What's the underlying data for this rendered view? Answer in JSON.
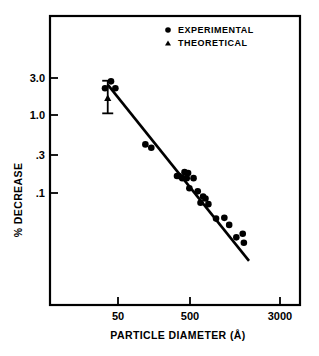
{
  "chart_data": {
    "type": "scatter",
    "title": "",
    "xlabel": "PARTICLE   DIAMETER (Å)",
    "ylabel": "% DECREASE",
    "xscale": "log",
    "yscale": "log",
    "xlim": [
      25,
      4000
    ],
    "ylim": [
      0.012,
      5.0
    ],
    "xticks": [
      50,
      500,
      3000
    ],
    "xtick_labels": [
      "50",
      "500",
      "3000"
    ],
    "yticks": [
      3.0,
      1.0,
      0.3,
      0.1
    ],
    "ytick_labels": [
      "3.0",
      "1.0",
      ".3",
      ".1"
    ],
    "grid": false,
    "legend_position": "top-right",
    "legend": [
      {
        "label": "EXPERIMENTAL",
        "marker": "circle"
      },
      {
        "label": "THEORETICAL",
        "marker": "triangle"
      }
    ],
    "series": [
      {
        "name": "EXPERIMENTAL",
        "marker": "circle",
        "points": [
          {
            "x": 33,
            "y": 2.2
          },
          {
            "x": 40,
            "y": 2.7
          },
          {
            "x": 46,
            "y": 2.2
          },
          {
            "x": 120,
            "y": 0.42
          },
          {
            "x": 145,
            "y": 0.38
          },
          {
            "x": 330,
            "y": 0.165
          },
          {
            "x": 350,
            "y": 0.165
          },
          {
            "x": 390,
            "y": 0.155
          },
          {
            "x": 420,
            "y": 0.185
          },
          {
            "x": 450,
            "y": 0.155
          },
          {
            "x": 470,
            "y": 0.18
          },
          {
            "x": 490,
            "y": 0.115
          },
          {
            "x": 560,
            "y": 0.155
          },
          {
            "x": 640,
            "y": 0.105
          },
          {
            "x": 700,
            "y": 0.075
          },
          {
            "x": 760,
            "y": 0.09
          },
          {
            "x": 820,
            "y": 0.085
          },
          {
            "x": 900,
            "y": 0.072
          },
          {
            "x": 1150,
            "y": 0.047
          },
          {
            "x": 1500,
            "y": 0.048
          },
          {
            "x": 1750,
            "y": 0.039
          },
          {
            "x": 2200,
            "y": 0.027
          },
          {
            "x": 2700,
            "y": 0.03
          },
          {
            "x": 2800,
            "y": 0.023
          }
        ]
      },
      {
        "name": "THEORETICAL",
        "marker": "triangle",
        "points": [
          {
            "x": 36,
            "y": 1.65
          }
        ]
      }
    ],
    "error_bars": [
      {
        "x": 36,
        "y": 1.65,
        "upper": 2.75,
        "lower": 1.05
      }
    ],
    "fit_line": {
      "x_start": 36,
      "y_start": 2.45,
      "x_end": 3300,
      "y_end": 0.0135
    }
  }
}
